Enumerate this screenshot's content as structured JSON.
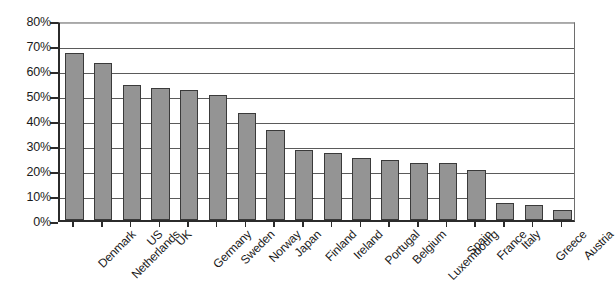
{
  "chart_data": {
    "type": "bar",
    "title": "",
    "subtitle": "",
    "xlabel": "",
    "ylabel": "",
    "ylim": [
      0,
      80
    ],
    "grid": true,
    "legend": false,
    "legend_position": "none",
    "y_tick_labels": [
      "80%",
      "70%",
      "60%",
      "50%",
      "40%",
      "30%",
      "20%",
      "10%",
      "0%"
    ],
    "y_tick_values": [
      80,
      70,
      60,
      50,
      40,
      30,
      20,
      10,
      0
    ],
    "categories": [
      "Denmark",
      "Netherlands",
      "US",
      "UK",
      "Germany",
      "Sweden",
      "Norway",
      "Japan",
      "Finland",
      "Ireland",
      "Portugal",
      "Belgium",
      "Luxembourg",
      "Spain",
      "France",
      "Italy",
      "Greece",
      "Austria"
    ],
    "values": [
      67,
      63,
      54,
      53,
      52,
      50,
      43,
      36,
      28,
      27,
      25,
      24,
      23,
      23,
      20,
      7,
      6,
      4
    ],
    "value_labels": [
      "67%",
      "63%",
      "54%",
      "53%",
      "52%",
      "50%",
      "43%",
      "36%",
      "28%",
      "27%",
      "25%",
      "24%",
      "23%",
      "23%",
      "20%",
      "7%",
      "6%",
      "4%"
    ],
    "bar_color": "#949494",
    "bar_border_color": "#3a3a3a",
    "axis_color": "#2b2b2b",
    "grid_color": "#5a5a5a",
    "background_color": "#ffffff"
  }
}
